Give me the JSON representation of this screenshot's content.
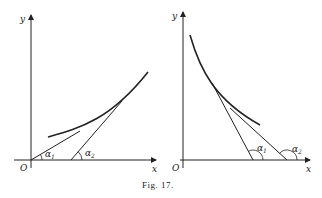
{
  "caption": "Fig. 17.",
  "left_panel": {
    "axis_x_label": "x",
    "axis_y_label": "y",
    "origin_label": "O",
    "angle_1_label": "α",
    "angle_1_sub": "1",
    "angle_2_label": "α",
    "angle_2_sub": "2",
    "description": "Convex increasing curve with two tangents; α1 < α2"
  },
  "right_panel": {
    "axis_x_label": "x",
    "axis_y_label": "y",
    "origin_label": "O",
    "angle_1_label": "α",
    "angle_1_sub": "1",
    "angle_2_label": "α",
    "angle_2_sub": "2",
    "description": "Convex decreasing curve with two tangents; obtuse angles α1 < α2"
  },
  "colors": {
    "ink": "#222222",
    "background": "#ffffff"
  }
}
